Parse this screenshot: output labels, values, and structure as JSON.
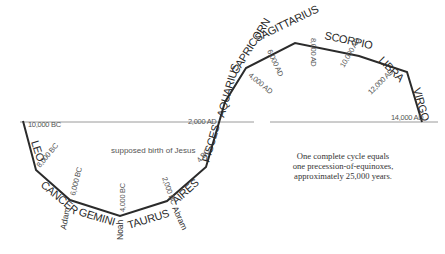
{
  "diagram": {
    "colors": {
      "path": "#2b2b2b",
      "baseline": "#9a9a9a",
      "text": "#333333"
    },
    "signs": [
      {
        "label": "LEO",
        "x": 31,
        "y": 142,
        "rot": 72
      },
      {
        "label": "CANCER",
        "x": 40,
        "y": 186,
        "rot": 40
      },
      {
        "label": "GEMINI",
        "x": 78,
        "y": 215,
        "rot": 17
      },
      {
        "label": "TAURUS",
        "x": 129,
        "y": 229,
        "rot": -17
      },
      {
        "label": "AIRES",
        "x": 176,
        "y": 205,
        "rot": -42
      },
      {
        "label": "PISCES",
        "x": 209,
        "y": 163,
        "rot": -74
      },
      {
        "label": "AQUARIUS",
        "x": 224,
        "y": 118,
        "rot": -74
      },
      {
        "label": "CAPRICORN",
        "x": 237,
        "y": 75,
        "rot": -58
      },
      {
        "label": "SAGITTARIUS",
        "x": 257,
        "y": 42,
        "rot": -26
      },
      {
        "label": "SCORPIO",
        "x": 324,
        "y": 39,
        "rot": 12
      },
      {
        "label": "LIBRA",
        "x": 378,
        "y": 61,
        "rot": 45
      },
      {
        "label": "VIRGO",
        "x": 413,
        "y": 89,
        "rot": 74
      }
    ],
    "dates": [
      {
        "label": "10,000 BC",
        "x": 28,
        "y": 127,
        "rot": 0
      },
      {
        "label": "8,000 BC",
        "x": 40,
        "y": 168,
        "rot": -50
      },
      {
        "label": "6,000 BC",
        "x": 75,
        "y": 196,
        "rot": -76
      },
      {
        "label": "4,000 BC",
        "x": 125,
        "y": 212,
        "rot": -90
      },
      {
        "label": "2,000 BC",
        "x": 162,
        "y": 178,
        "rot": 70
      },
      {
        "label": "4 BC",
        "x": 200,
        "y": 163,
        "rot": -50
      },
      {
        "label": "2,000 AD",
        "x": 188,
        "y": 124,
        "rot": 0
      },
      {
        "label": "4,000 AD",
        "x": 248,
        "y": 76,
        "rot": 40
      },
      {
        "label": "6,000 AD",
        "x": 267,
        "y": 51,
        "rot": 65
      },
      {
        "label": "8,000 AD",
        "x": 311,
        "y": 38,
        "rot": 90
      },
      {
        "label": "10,000 AD",
        "x": 344,
        "y": 68,
        "rot": -60
      },
      {
        "label": "12,000 AD",
        "x": 371,
        "y": 95,
        "rot": -45
      },
      {
        "label": "14,000 AD",
        "x": 391,
        "y": 120,
        "rot": 0
      }
    ],
    "figures": [
      {
        "label": "Adam",
        "x": 66,
        "y": 230,
        "rot": -80
      },
      {
        "label": "Noah",
        "x": 123,
        "y": 240,
        "rot": -90
      },
      {
        "label": "Abram",
        "x": 172,
        "y": 208,
        "rot": 65
      }
    ],
    "annotation": {
      "label": "supposed birth of Jesus",
      "x": 111,
      "y": 153
    },
    "caption": [
      "One complete cycle equals",
      "one precession-of-equinoxes,",
      "approximately 25,000 years."
    ]
  }
}
